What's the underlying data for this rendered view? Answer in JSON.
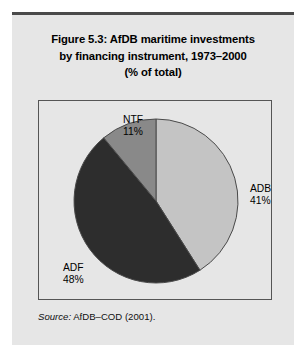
{
  "figure": {
    "title_lines": [
      "Figure 5.3:  AfDB maritime investments",
      "by financing instrument, 1973–2000",
      "(% of total)"
    ],
    "source_label": "Source:",
    "source_text": " AfDB–COD (2001)."
  },
  "chart_data": {
    "type": "pie",
    "title": "Figure 5.3: AfDB maritime investments by financing instrument, 1973–2000 (% of total)",
    "xlabel": "",
    "ylabel": "",
    "unit": "% of total",
    "start_angle_deg": 0,
    "direction": "clockwise",
    "legend": "none (direct slice labels)",
    "categories": [
      "ADB",
      "ADF",
      "NTF"
    ],
    "values": [
      41,
      48,
      11
    ],
    "slices": [
      {
        "name": "ADB",
        "value": 41,
        "value_label": "41%",
        "color": "#c4c4c4"
      },
      {
        "name": "ADF",
        "value": 48,
        "value_label": "48%",
        "color": "#2d2d2d"
      },
      {
        "name": "NTF",
        "value": 11,
        "value_label": "11%",
        "color": "#898989"
      }
    ]
  },
  "colors": {
    "panel_background": "#e6e6e6",
    "frame_border": "#555555",
    "top_rule": "#4a4a4a",
    "text": "#000000",
    "slice_outline": "#4a4a4a"
  }
}
